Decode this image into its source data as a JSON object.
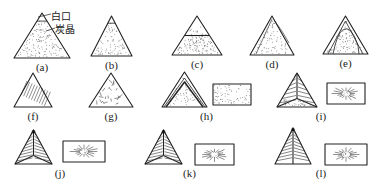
{
  "figure": {
    "annotations": {
      "white_iron": "白口",
      "graphite": "炭晶"
    },
    "panels": [
      {
        "id": "a",
        "label": "(a)",
        "x": 14,
        "y": 13,
        "w": 56,
        "h": 45,
        "type": "dotted-tip"
      },
      {
        "id": "b",
        "label": "(b)",
        "x": 91,
        "y": 16,
        "w": 41,
        "h": 40,
        "type": "dotted-tip"
      },
      {
        "id": "c",
        "label": "(c)",
        "x": 172,
        "y": 16,
        "w": 50,
        "h": 39,
        "type": "dotted-band"
      },
      {
        "id": "d",
        "label": "(d)",
        "x": 250,
        "y": 16,
        "w": 44,
        "h": 39,
        "type": "dotted-edge"
      },
      {
        "id": "e",
        "label": "(e)",
        "x": 323,
        "y": 16,
        "w": 45,
        "h": 38,
        "type": "dotted-rim"
      },
      {
        "id": "f",
        "label": "(f)",
        "x": 14,
        "y": 73,
        "w": 38,
        "h": 34,
        "type": "hatched"
      },
      {
        "id": "g",
        "label": "(g)",
        "x": 89,
        "y": 73,
        "w": 44,
        "h": 34,
        "type": "hatched-radial"
      },
      {
        "id": "h",
        "label": "(h)",
        "x": 162,
        "y": 72,
        "w": 45,
        "h": 35,
        "type": "nested",
        "rect": {
          "x": 213,
          "y": 84,
          "w": 38,
          "h": 21
        }
      },
      {
        "id": "i",
        "label": "(i)",
        "x": 277,
        "y": 73,
        "w": 40,
        "h": 34,
        "type": "sectored",
        "rect": {
          "x": 327,
          "y": 83,
          "w": 38,
          "h": 21
        }
      },
      {
        "id": "j",
        "label": "(j)",
        "x": 15,
        "y": 130,
        "w": 37,
        "h": 34,
        "type": "sectored-lines",
        "rect": {
          "x": 63,
          "y": 141,
          "w": 42,
          "h": 21
        }
      },
      {
        "id": "k",
        "label": "(k)",
        "x": 145,
        "y": 130,
        "w": 37,
        "h": 34,
        "type": "sectored-lines",
        "rect": {
          "x": 195,
          "y": 144,
          "w": 39,
          "h": 21
        }
      },
      {
        "id": "l",
        "label": "(l)",
        "x": 275,
        "y": 128,
        "w": 36,
        "h": 36,
        "type": "split-lines",
        "rect": {
          "x": 325,
          "y": 144,
          "w": 42,
          "h": 21
        }
      }
    ]
  }
}
